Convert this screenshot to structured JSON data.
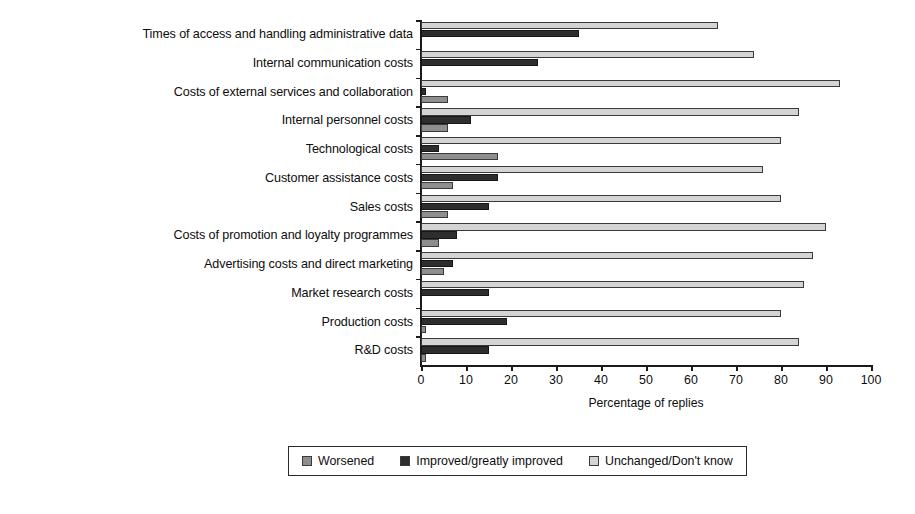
{
  "chart_data": {
    "type": "bar",
    "orientation": "horizontal",
    "title": "",
    "xlabel": "Percentage of replies",
    "ylabel": "",
    "xlim": [
      0,
      100
    ],
    "xticks": [
      0,
      10,
      20,
      30,
      40,
      50,
      60,
      70,
      80,
      90,
      100
    ],
    "grid": false,
    "legend_position": "bottom",
    "categories": [
      "Times of access and handling administrative data",
      "Internal communication costs",
      "Costs of external services and collaboration",
      "Internal personnel costs",
      "Technological costs",
      "Customer assistance costs",
      "Sales costs",
      "Costs of promotion and loyalty programmes",
      "Advertising costs and direct marketing",
      "Market research costs",
      "Production costs",
      "R&D costs"
    ],
    "series": [
      {
        "name": "Unchanged/Don't know",
        "color": "#d4d4d4",
        "values": [
          66,
          74,
          93,
          84,
          80,
          76,
          80,
          90,
          87,
          85,
          80,
          84
        ]
      },
      {
        "name": "Improved/greatly improved",
        "color": "#2e2e2e",
        "values": [
          35,
          26,
          1,
          11,
          4,
          17,
          15,
          8,
          7,
          15,
          19,
          15
        ]
      },
      {
        "name": "Worsened",
        "color": "#8e8e8e",
        "values": [
          0,
          0,
          6,
          6,
          17,
          7,
          6,
          4,
          5,
          0,
          1,
          1
        ]
      }
    ]
  },
  "legend": {
    "items": [
      {
        "label": "Worsened",
        "color": "#8e8e8e"
      },
      {
        "label": "Improved/greatly improved",
        "color": "#2e2e2e"
      },
      {
        "label": "Unchanged/Don't know",
        "color": "#d4d4d4"
      }
    ]
  }
}
